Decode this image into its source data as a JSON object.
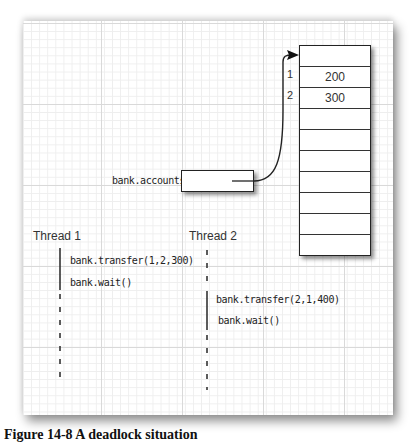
{
  "diagram": {
    "array": {
      "cells": [
        "",
        "200",
        "300",
        "",
        "",
        "",
        "",
        "",
        "",
        ""
      ],
      "indices": [
        {
          "label": "1",
          "row": 1
        },
        {
          "label": "2",
          "row": 2
        }
      ]
    },
    "reference": {
      "label": "bank.accounts"
    },
    "threads": [
      {
        "name": "Thread 1",
        "calls": [
          "bank.transfer(1,2,300)",
          "bank.wait()"
        ]
      },
      {
        "name": "Thread 2",
        "calls": [
          "bank.transfer(2,1,400)",
          "bank.wait()"
        ]
      }
    ],
    "colors": {
      "ink": "#222222",
      "grid_major": "#d9d9d9",
      "grid_minor": "#eeeeee",
      "paper": "#ffffff"
    }
  },
  "caption": "Figure 14-8 A deadlock situation"
}
